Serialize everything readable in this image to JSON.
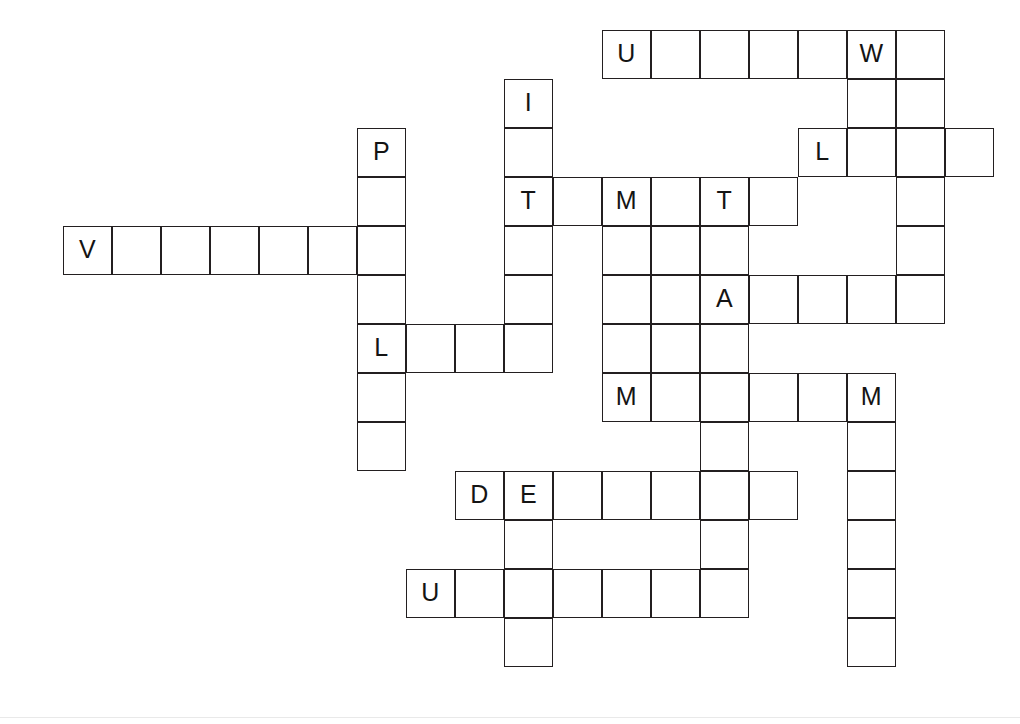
{
  "puzzle": {
    "title": "Crossword Grid",
    "type": "crossword-grid",
    "grid": {
      "cell_size": 49,
      "origin_x": 63,
      "origin_y": 30,
      "columns": 19,
      "rows": 14,
      "border_color": "#231f20",
      "cell_background": "#ffffff",
      "letter_color": "#141414"
    },
    "entries": [
      {
        "id": "a1",
        "direction": "across",
        "row": 0,
        "col": 11,
        "length": 7,
        "letters": [
          "U",
          "",
          "",
          "",
          "",
          "W",
          ""
        ]
      },
      {
        "id": "a2",
        "direction": "across",
        "row": 2,
        "col": 15,
        "length": 4,
        "letters": [
          "L",
          "",
          "",
          ""
        ]
      },
      {
        "id": "a3",
        "direction": "across",
        "row": 3,
        "col": 9,
        "length": 6,
        "letters": [
          "T",
          "",
          "M",
          "",
          "T",
          ""
        ]
      },
      {
        "id": "a4",
        "direction": "across",
        "row": 4,
        "col": 0,
        "length": 7,
        "letters": [
          "V",
          "",
          "",
          "",
          "",
          "",
          ""
        ]
      },
      {
        "id": "a5",
        "direction": "across",
        "row": 5,
        "col": 13,
        "length": 4,
        "letters": [
          "A",
          "",
          "",
          ""
        ]
      },
      {
        "id": "a6",
        "direction": "across",
        "row": 6,
        "col": 6,
        "length": 4,
        "letters": [
          "L",
          "",
          "",
          ""
        ]
      },
      {
        "id": "a7",
        "direction": "across",
        "row": 7,
        "col": 11,
        "length": 6,
        "letters": [
          "M",
          "",
          "",
          "",
          "",
          "M"
        ]
      },
      {
        "id": "a8",
        "direction": "across",
        "row": 9,
        "col": 8,
        "length": 7,
        "letters": [
          "D",
          "E",
          "",
          "",
          "",
          "",
          ""
        ]
      },
      {
        "id": "a9",
        "direction": "across",
        "row": 11,
        "col": 7,
        "length": 7,
        "letters": [
          "U",
          "",
          "",
          "",
          "",
          "",
          ""
        ]
      },
      {
        "id": "d1",
        "direction": "down",
        "row": 1,
        "col": 9,
        "length": 7,
        "letters": [
          "I",
          "",
          "T",
          "",
          "",
          "",
          ""
        ]
      },
      {
        "id": "d2",
        "direction": "down",
        "row": 2,
        "col": 6,
        "length": 7,
        "letters": [
          "P",
          "",
          "",
          "",
          "L",
          "",
          ""
        ]
      },
      {
        "id": "d3",
        "direction": "down",
        "row": 0,
        "col": 16,
        "length": 3,
        "letters": [
          "W",
          "",
          ""
        ]
      },
      {
        "id": "d4",
        "direction": "down",
        "row": 0,
        "col": 17,
        "length": 6,
        "letters": [
          "",
          "",
          "",
          "",
          "",
          ""
        ]
      },
      {
        "id": "d5",
        "direction": "down",
        "row": 3,
        "col": 11,
        "length": 5,
        "letters": [
          "M",
          "",
          "",
          "",
          "M"
        ]
      },
      {
        "id": "d6",
        "direction": "down",
        "row": 3,
        "col": 12,
        "length": 5,
        "letters": [
          "",
          "",
          "",
          "",
          ""
        ]
      },
      {
        "id": "d7",
        "direction": "down",
        "row": 3,
        "col": 13,
        "length": 9,
        "letters": [
          "T",
          "",
          "A",
          "",
          "",
          "",
          "",
          "",
          ""
        ]
      },
      {
        "id": "d8",
        "direction": "down",
        "row": 7,
        "col": 16,
        "length": 7,
        "letters": [
          "M",
          "",
          "",
          "",
          "",
          "",
          ""
        ]
      },
      {
        "id": "d9",
        "direction": "down",
        "row": 9,
        "col": 9,
        "length": 5,
        "letters": [
          "E",
          "",
          "",
          "",
          ""
        ]
      }
    ],
    "cells": [
      {
        "r": 0,
        "c": 11,
        "letter": "U"
      },
      {
        "r": 0,
        "c": 12,
        "letter": ""
      },
      {
        "r": 0,
        "c": 13,
        "letter": ""
      },
      {
        "r": 0,
        "c": 14,
        "letter": ""
      },
      {
        "r": 0,
        "c": 15,
        "letter": ""
      },
      {
        "r": 0,
        "c": 16,
        "letter": "W"
      },
      {
        "r": 0,
        "c": 17,
        "letter": ""
      },
      {
        "r": 1,
        "c": 9,
        "letter": "I"
      },
      {
        "r": 1,
        "c": 16,
        "letter": ""
      },
      {
        "r": 1,
        "c": 17,
        "letter": ""
      },
      {
        "r": 2,
        "c": 6,
        "letter": "P"
      },
      {
        "r": 2,
        "c": 9,
        "letter": ""
      },
      {
        "r": 2,
        "c": 15,
        "letter": "L"
      },
      {
        "r": 2,
        "c": 16,
        "letter": ""
      },
      {
        "r": 2,
        "c": 17,
        "letter": ""
      },
      {
        "r": 2,
        "c": 18,
        "letter": ""
      },
      {
        "r": 3,
        "c": 6,
        "letter": ""
      },
      {
        "r": 3,
        "c": 9,
        "letter": "T"
      },
      {
        "r": 3,
        "c": 10,
        "letter": ""
      },
      {
        "r": 3,
        "c": 11,
        "letter": "M"
      },
      {
        "r": 3,
        "c": 12,
        "letter": ""
      },
      {
        "r": 3,
        "c": 13,
        "letter": "T"
      },
      {
        "r": 3,
        "c": 14,
        "letter": ""
      },
      {
        "r": 3,
        "c": 17,
        "letter": ""
      },
      {
        "r": 4,
        "c": 0,
        "letter": "V"
      },
      {
        "r": 4,
        "c": 1,
        "letter": ""
      },
      {
        "r": 4,
        "c": 2,
        "letter": ""
      },
      {
        "r": 4,
        "c": 3,
        "letter": ""
      },
      {
        "r": 4,
        "c": 4,
        "letter": ""
      },
      {
        "r": 4,
        "c": 5,
        "letter": ""
      },
      {
        "r": 4,
        "c": 6,
        "letter": ""
      },
      {
        "r": 4,
        "c": 9,
        "letter": ""
      },
      {
        "r": 4,
        "c": 11,
        "letter": ""
      },
      {
        "r": 4,
        "c": 12,
        "letter": ""
      },
      {
        "r": 4,
        "c": 13,
        "letter": ""
      },
      {
        "r": 4,
        "c": 17,
        "letter": ""
      },
      {
        "r": 5,
        "c": 6,
        "letter": ""
      },
      {
        "r": 5,
        "c": 9,
        "letter": ""
      },
      {
        "r": 5,
        "c": 11,
        "letter": ""
      },
      {
        "r": 5,
        "c": 12,
        "letter": ""
      },
      {
        "r": 5,
        "c": 13,
        "letter": "A"
      },
      {
        "r": 5,
        "c": 14,
        "letter": ""
      },
      {
        "r": 5,
        "c": 15,
        "letter": ""
      },
      {
        "r": 5,
        "c": 16,
        "letter": ""
      },
      {
        "r": 5,
        "c": 17,
        "letter": ""
      },
      {
        "r": 6,
        "c": 6,
        "letter": "L"
      },
      {
        "r": 6,
        "c": 7,
        "letter": ""
      },
      {
        "r": 6,
        "c": 8,
        "letter": ""
      },
      {
        "r": 6,
        "c": 9,
        "letter": ""
      },
      {
        "r": 6,
        "c": 11,
        "letter": ""
      },
      {
        "r": 6,
        "c": 12,
        "letter": ""
      },
      {
        "r": 6,
        "c": 13,
        "letter": ""
      },
      {
        "r": 7,
        "c": 6,
        "letter": ""
      },
      {
        "r": 7,
        "c": 11,
        "letter": "M"
      },
      {
        "r": 7,
        "c": 12,
        "letter": ""
      },
      {
        "r": 7,
        "c": 13,
        "letter": ""
      },
      {
        "r": 7,
        "c": 14,
        "letter": ""
      },
      {
        "r": 7,
        "c": 15,
        "letter": ""
      },
      {
        "r": 7,
        "c": 16,
        "letter": "M"
      },
      {
        "r": 8,
        "c": 6,
        "letter": ""
      },
      {
        "r": 8,
        "c": 13,
        "letter": ""
      },
      {
        "r": 8,
        "c": 16,
        "letter": ""
      },
      {
        "r": 9,
        "c": 8,
        "letter": "D"
      },
      {
        "r": 9,
        "c": 9,
        "letter": "E"
      },
      {
        "r": 9,
        "c": 10,
        "letter": ""
      },
      {
        "r": 9,
        "c": 11,
        "letter": ""
      },
      {
        "r": 9,
        "c": 12,
        "letter": ""
      },
      {
        "r": 9,
        "c": 13,
        "letter": ""
      },
      {
        "r": 9,
        "c": 14,
        "letter": ""
      },
      {
        "r": 9,
        "c": 16,
        "letter": ""
      },
      {
        "r": 10,
        "c": 9,
        "letter": ""
      },
      {
        "r": 10,
        "c": 13,
        "letter": ""
      },
      {
        "r": 10,
        "c": 16,
        "letter": ""
      },
      {
        "r": 11,
        "c": 7,
        "letter": "U"
      },
      {
        "r": 11,
        "c": 8,
        "letter": ""
      },
      {
        "r": 11,
        "c": 9,
        "letter": ""
      },
      {
        "r": 11,
        "c": 10,
        "letter": ""
      },
      {
        "r": 11,
        "c": 11,
        "letter": ""
      },
      {
        "r": 11,
        "c": 12,
        "letter": ""
      },
      {
        "r": 11,
        "c": 13,
        "letter": ""
      },
      {
        "r": 11,
        "c": 16,
        "letter": ""
      },
      {
        "r": 12,
        "c": 9,
        "letter": ""
      },
      {
        "r": 12,
        "c": 16,
        "letter": ""
      }
    ]
  }
}
